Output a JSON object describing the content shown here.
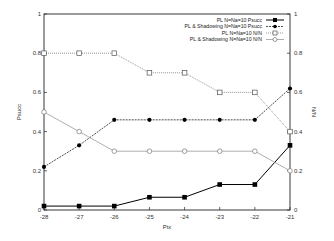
{
  "chart_data": {
    "type": "line",
    "title": "",
    "xlabel": "Ptx",
    "ylabel": "Psucc",
    "ylabel_right": "N/N",
    "x": [
      -28,
      -27,
      -26,
      -25,
      -24,
      -23,
      -22,
      -21
    ],
    "xlim": [
      -28,
      -21
    ],
    "ylim": [
      0,
      1
    ],
    "ylim_right": [
      0,
      1
    ],
    "x_ticks": [
      "-28",
      "-27",
      "-26",
      "-25",
      "-24",
      "-23",
      "-22",
      "-21"
    ],
    "y_ticks": [
      "0",
      "0.2",
      "0.4",
      "0.6",
      "0.8",
      "1"
    ],
    "y_ticks_right": [
      "0",
      "0.2",
      "0.4",
      "0.6",
      "0.8",
      "1"
    ],
    "grid": false,
    "legend_position": "upper right",
    "series": [
      {
        "name": "PL N=Na=10 Psucc",
        "axis": "left",
        "marker": "filled-square",
        "line": "solid",
        "color": "#000000",
        "values": [
          0.02,
          0.02,
          0.02,
          0.065,
          0.065,
          0.13,
          0.13,
          0.33
        ]
      },
      {
        "name": "PL & Shadowing N=Na=10 Psucc",
        "axis": "left",
        "marker": "filled-circle",
        "line": "dashed",
        "color": "#000000",
        "values": [
          0.22,
          0.33,
          0.46,
          0.46,
          0.46,
          0.46,
          0.46,
          0.62
        ]
      },
      {
        "name": "PL N=Na=10 N/N",
        "axis": "right",
        "marker": "open-square",
        "line": "dotted",
        "color": "#555555",
        "values": [
          0.8,
          0.8,
          0.8,
          0.7,
          0.7,
          0.6,
          0.6,
          0.4
        ]
      },
      {
        "name": "PL & Shadowing N=Na=10 N/N",
        "axis": "right",
        "marker": "open-circle",
        "line": "solid-gray",
        "color": "#888888",
        "values": [
          0.5,
          0.4,
          0.3,
          0.3,
          0.3,
          0.3,
          0.3,
          0.2
        ]
      }
    ]
  }
}
